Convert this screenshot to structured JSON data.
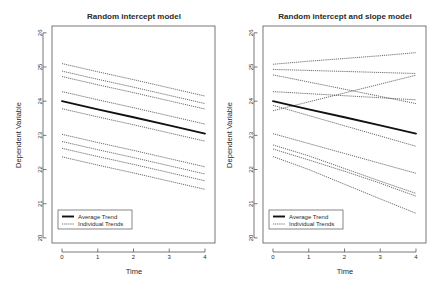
{
  "figure": {
    "background": "#ffffff",
    "axis_color": "#555555",
    "text_color": "#2b2b2b",
    "average_color": "#111111",
    "individual_color": "#2e2e2e"
  },
  "chart_data": [
    {
      "type": "line",
      "panel": "left",
      "title": "Random intercept model",
      "xlabel": "Time",
      "ylabel": "Dependent Variable",
      "x": [
        0,
        1,
        2,
        3,
        4
      ],
      "xlim": [
        -0.28,
        4.28
      ],
      "ylim": [
        19.85,
        26.2
      ],
      "xticks": [
        0,
        1,
        2,
        3,
        4
      ],
      "xticklabels": [
        "0",
        "1",
        "2",
        "3",
        "4"
      ],
      "yticks": [
        20,
        21,
        22,
        23,
        24,
        25,
        26
      ],
      "yticklabels": [
        "20",
        "21",
        "22",
        "23",
        "24",
        "25",
        "26"
      ],
      "grid": false,
      "legend_position": "bottom-left",
      "legend": [
        "Average Trend",
        "Individual Trends"
      ],
      "series": [
        {
          "name": "Average Trend",
          "kind": "average",
          "values": [
            24.0,
            23.76,
            23.53,
            23.29,
            23.05
          ]
        },
        {
          "name": "Individual 1",
          "kind": "individual",
          "values": [
            25.1,
            24.86,
            24.63,
            24.39,
            24.15
          ]
        },
        {
          "name": "Individual 2",
          "kind": "individual",
          "values": [
            24.88,
            24.64,
            24.41,
            24.17,
            23.93
          ]
        },
        {
          "name": "Individual 3",
          "kind": "individual",
          "values": [
            24.72,
            24.48,
            24.25,
            24.01,
            23.77
          ]
        },
        {
          "name": "Individual 4",
          "kind": "individual",
          "values": [
            24.28,
            24.04,
            23.81,
            23.57,
            23.33
          ]
        },
        {
          "name": "Individual 5",
          "kind": "individual",
          "values": [
            23.78,
            23.54,
            23.31,
            23.07,
            22.83
          ]
        },
        {
          "name": "Individual 6",
          "kind": "individual",
          "values": [
            23.03,
            22.79,
            22.56,
            22.32,
            22.08
          ]
        },
        {
          "name": "Individual 7",
          "kind": "individual",
          "values": [
            22.82,
            22.58,
            22.35,
            22.11,
            21.87
          ]
        },
        {
          "name": "Individual 8",
          "kind": "individual",
          "values": [
            22.62,
            22.38,
            22.15,
            21.91,
            21.67
          ]
        },
        {
          "name": "Individual 9",
          "kind": "individual",
          "values": [
            22.37,
            22.13,
            21.9,
            21.66,
            21.42
          ]
        }
      ]
    },
    {
      "type": "line",
      "panel": "right",
      "title": "Random intercept and slope model",
      "xlabel": "Time",
      "ylabel": "Dependent Variable",
      "x": [
        0,
        1,
        2,
        3,
        4
      ],
      "xlim": [
        -0.28,
        4.28
      ],
      "ylim": [
        19.85,
        26.2
      ],
      "xticks": [
        0,
        1,
        2,
        3,
        4
      ],
      "xticklabels": [
        "0",
        "1",
        "2",
        "3",
        "4"
      ],
      "yticks": [
        20,
        21,
        22,
        23,
        24,
        25,
        26
      ],
      "yticklabels": [
        "20",
        "21",
        "22",
        "23",
        "24",
        "25",
        "26"
      ],
      "grid": false,
      "legend_position": "bottom-left",
      "legend": [
        "Average Trend",
        "Individual Trends"
      ],
      "series": [
        {
          "name": "Average Trend",
          "kind": "average",
          "values": [
            24.0,
            23.76,
            23.53,
            23.29,
            23.05
          ]
        },
        {
          "name": "Individual 1",
          "kind": "individual",
          "values": [
            25.08,
            25.17,
            25.25,
            25.33,
            25.42
          ]
        },
        {
          "name": "Individual 2",
          "kind": "individual",
          "values": [
            24.93,
            24.9,
            24.87,
            24.84,
            24.81
          ]
        },
        {
          "name": "Individual 3",
          "kind": "individual",
          "values": [
            24.77,
            24.56,
            24.35,
            24.14,
            23.93
          ]
        },
        {
          "name": "Individual 4",
          "kind": "individual",
          "values": [
            24.28,
            24.22,
            24.16,
            24.1,
            24.04
          ]
        },
        {
          "name": "Individual 5",
          "kind": "individual",
          "values": [
            23.72,
            23.98,
            24.24,
            24.5,
            24.76
          ]
        },
        {
          "name": "Individual 6",
          "kind": "individual",
          "values": [
            23.88,
            23.58,
            23.28,
            22.98,
            22.68
          ]
        },
        {
          "name": "Individual 7",
          "kind": "individual",
          "values": [
            23.05,
            22.76,
            22.47,
            22.18,
            21.89
          ]
        },
        {
          "name": "Individual 8",
          "kind": "individual",
          "values": [
            22.72,
            22.4,
            22.03,
            21.66,
            21.3
          ]
        },
        {
          "name": "Individual 9",
          "kind": "individual",
          "values": [
            22.6,
            22.28,
            21.95,
            21.6,
            21.22
          ]
        },
        {
          "name": "Individual 10",
          "kind": "individual",
          "values": [
            22.38,
            22.0,
            21.57,
            21.14,
            20.72
          ]
        }
      ]
    }
  ]
}
